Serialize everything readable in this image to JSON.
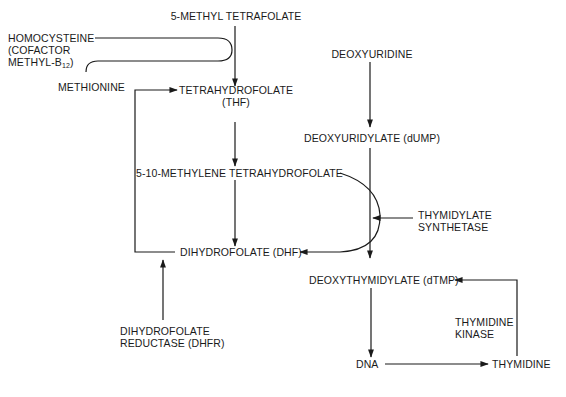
{
  "diagram": {
    "folate_cycle": {
      "methyl_thf": "5-METHYL TETRAFOLATE",
      "homocysteine": "HOMOCYSTEINE",
      "cofactor_line1": "(COFACTOR",
      "cofactor_line2": "METHYL-B",
      "cofactor_sub": "12",
      "cofactor_close": ")",
      "methionine": "METHIONINE",
      "thf_line1": "TETRAHYDROFOLATE",
      "thf_line2": "(THF)",
      "methylene_thf": "5-10-METHYLENE TETRAHYDROFOLATE",
      "dhf": "DIHYDROFOLATE (DHF)",
      "dhfr_line1": "DIHYDROFOLATE",
      "dhfr_line2": "REDUCTASE (DHFR)"
    },
    "thymidylate_pathway": {
      "deoxyuridine": "DEOXYURIDINE",
      "dump": "DEOXYURIDYLATE (dUMP)",
      "ts_line1": "THYMIDYLATE",
      "ts_line2": "SYNTHETASE",
      "dtmp": "DEOXYTHYMIDYLATE (dTMP)",
      "tk_line1": "THYMIDINE",
      "tk_line2": "KINASE",
      "dna": "DNA",
      "thymidine": "THYMIDINE"
    },
    "colors": {
      "ink": "#1a1a1a",
      "background": "#ffffff"
    }
  }
}
